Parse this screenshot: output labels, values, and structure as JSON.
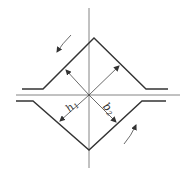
{
  "diagram": {
    "labels": {
      "h1": "h",
      "h1_sub": "1",
      "h2": "b",
      "h2_sub": "2"
    },
    "colors": {
      "stroke": "#333333",
      "axis": "#777777",
      "background": "#ffffff"
    }
  }
}
